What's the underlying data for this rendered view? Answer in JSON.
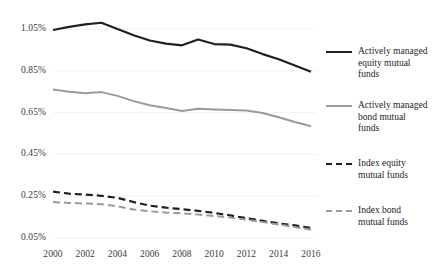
{
  "chart_data": {
    "type": "line",
    "title": "",
    "xlabel": "",
    "ylabel": "",
    "x": [
      2000,
      2001,
      2002,
      2003,
      2004,
      2005,
      2006,
      2007,
      2008,
      2009,
      2010,
      2011,
      2012,
      2013,
      2014,
      2015,
      2016
    ],
    "xticks": [
      "2000",
      "2002",
      "2004",
      "2006",
      "2008",
      "2010",
      "2012",
      "2014",
      "2016"
    ],
    "yticks": [
      "0.05%",
      "0.25%",
      "0.45%",
      "0.65%",
      "0.85%",
      "1.05%"
    ],
    "ylim": [
      0.05,
      1.05
    ],
    "xlim": [
      2000,
      2016
    ],
    "grid": true,
    "grid_color": "#f2f2f2",
    "legend_position": "right",
    "series": [
      {
        "name": "Actively managed equity mutual funds",
        "color": "#231f20",
        "style": "solid",
        "width": 2.2,
        "values": [
          1.045,
          1.06,
          1.072,
          1.08,
          1.05,
          1.02,
          0.995,
          0.98,
          0.972,
          1.0,
          0.978,
          0.975,
          0.958,
          0.93,
          0.905,
          0.875,
          0.845
        ]
      },
      {
        "name": "Actively managed bond mutual funds",
        "color": "#9a9a9a",
        "style": "solid",
        "width": 2.0,
        "values": [
          0.76,
          0.75,
          0.743,
          0.748,
          0.73,
          0.705,
          0.685,
          0.672,
          0.658,
          0.668,
          0.665,
          0.662,
          0.66,
          0.648,
          0.628,
          0.605,
          0.585
        ]
      },
      {
        "name": "Index equity mutual funds",
        "color": "#231f20",
        "style": "dashed",
        "width": 2.2,
        "values": [
          0.272,
          0.262,
          0.258,
          0.252,
          0.242,
          0.222,
          0.205,
          0.195,
          0.188,
          0.18,
          0.17,
          0.158,
          0.145,
          0.132,
          0.12,
          0.11,
          0.098
        ]
      },
      {
        "name": "Index bond mutual funds",
        "color": "#9a9a9a",
        "style": "dashed",
        "width": 2.0,
        "values": [
          0.222,
          0.218,
          0.215,
          0.212,
          0.202,
          0.186,
          0.178,
          0.172,
          0.168,
          0.162,
          0.155,
          0.148,
          0.138,
          0.126,
          0.115,
          0.102,
          0.09
        ]
      }
    ]
  },
  "legend": {
    "items": [
      {
        "line1": "Actively managed",
        "line2": "equity mutual",
        "line3": "funds"
      },
      {
        "line1": "Actively managed",
        "line2": "bond mutual",
        "line3": "funds"
      },
      {
        "line1": "Index equity",
        "line2": "mutual funds",
        "line3": ""
      },
      {
        "line1": "Index bond",
        "line2": "mutual funds",
        "line3": ""
      }
    ]
  }
}
